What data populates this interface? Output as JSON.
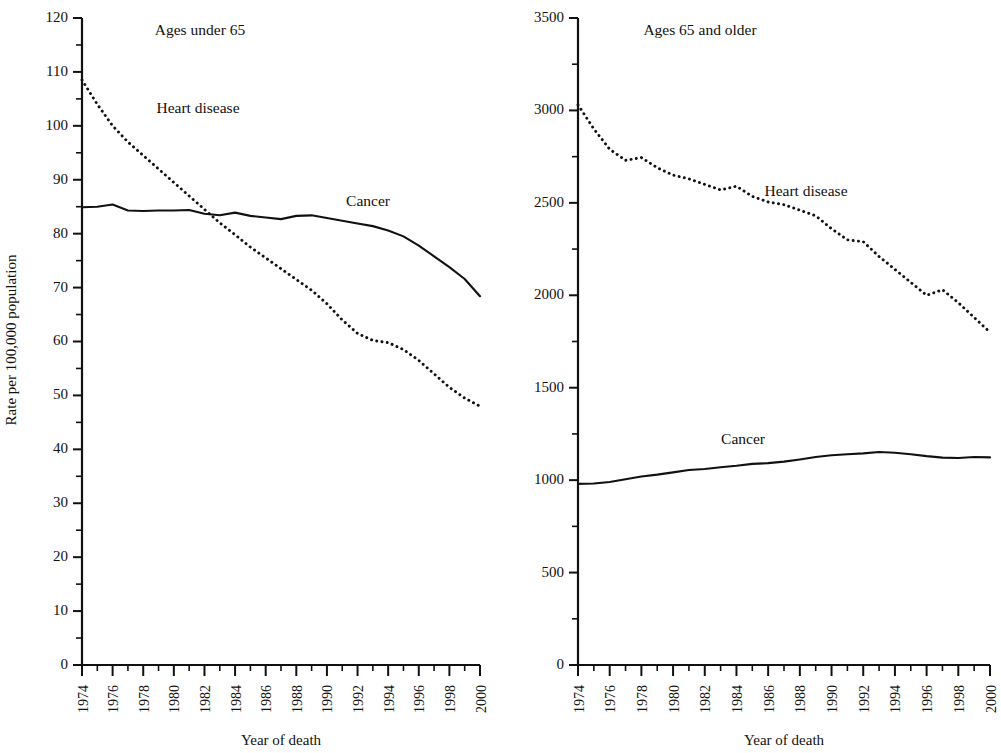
{
  "figure": {
    "x_axis_title": "Year of death",
    "y_axis_title": "Rate per 100,000 population"
  },
  "panels": {
    "left": {
      "title": "Ages under 65",
      "series_label_heart": "Heart disease",
      "series_label_cancer": "Cancer"
    },
    "right": {
      "title": "Ages 65 and older",
      "series_label_heart": "Heart disease",
      "series_label_cancer": "Cancer"
    }
  },
  "chart_data": [
    {
      "type": "line",
      "title": "Ages under 65",
      "xlabel": "Year of death",
      "ylabel": "Rate per 100,000 population",
      "xlim": [
        1974,
        2000
      ],
      "ylim": [
        0,
        120
      ],
      "ytick_labels": [
        "0",
        "10",
        "20",
        "30",
        "40",
        "50",
        "60",
        "70",
        "80",
        "90",
        "100",
        "110",
        "120"
      ],
      "ytick_values": [
        0,
        10,
        20,
        30,
        40,
        50,
        60,
        70,
        80,
        90,
        100,
        110,
        120
      ],
      "yminor_step": 5,
      "xtick_labels": [
        "1974",
        "1976",
        "1978",
        "1980",
        "1982",
        "1984",
        "1986",
        "1988",
        "1990",
        "1992",
        "1994",
        "1996",
        "1998",
        "2000"
      ],
      "xtick_values": [
        1974,
        1976,
        1978,
        1980,
        1982,
        1984,
        1986,
        1988,
        1990,
        1992,
        1994,
        1996,
        1998,
        2000
      ],
      "xminor_step": 1,
      "grid": false,
      "legend": "inline-annotation",
      "x": [
        1974,
        1975,
        1976,
        1977,
        1978,
        1979,
        1980,
        1981,
        1982,
        1983,
        1984,
        1985,
        1986,
        1987,
        1988,
        1989,
        1990,
        1991,
        1992,
        1993,
        1994,
        1995,
        1996,
        1997,
        1998,
        1999,
        2000
      ],
      "series": [
        {
          "name": "Heart disease",
          "style": "dotted",
          "values": [
            108.5,
            104.0,
            100.0,
            97.0,
            94.5,
            92.0,
            89.5,
            87.0,
            84.5,
            82.0,
            79.8,
            77.5,
            75.5,
            73.5,
            71.5,
            69.5,
            67.0,
            64.0,
            61.5,
            60.2,
            59.8,
            58.5,
            56.5,
            54.0,
            51.5,
            49.5,
            48.0
          ]
        },
        {
          "name": "Cancer",
          "style": "solid",
          "values": [
            84.9,
            85.0,
            85.4,
            84.3,
            84.2,
            84.3,
            84.3,
            84.4,
            83.7,
            83.4,
            83.9,
            83.3,
            83.0,
            82.7,
            83.3,
            83.4,
            82.9,
            82.4,
            81.9,
            81.4,
            80.6,
            79.5,
            77.8,
            75.8,
            73.8,
            71.6,
            68.4,
            66.0
          ]
        }
      ]
    },
    {
      "type": "line",
      "title": "Ages 65 and older",
      "xlabel": "Year of death",
      "ylabel": "Rate per 100,000 population",
      "xlim": [
        1974,
        2000
      ],
      "ylim": [
        0,
        3500
      ],
      "ytick_labels": [
        "0",
        "500",
        "1000",
        "1500",
        "2000",
        "2500",
        "3000",
        "3500"
      ],
      "ytick_values": [
        0,
        500,
        1000,
        1500,
        2000,
        2500,
        3000,
        3500
      ],
      "yminor_step": 250,
      "xtick_labels": [
        "1974",
        "1976",
        "1978",
        "1980",
        "1982",
        "1984",
        "1986",
        "1988",
        "1990",
        "1992",
        "1994",
        "1996",
        "1998",
        "2000"
      ],
      "xtick_values": [
        1974,
        1976,
        1978,
        1980,
        1982,
        1984,
        1986,
        1988,
        1990,
        1992,
        1994,
        1996,
        1998,
        2000
      ],
      "xminor_step": 1,
      "grid": false,
      "legend": "inline-annotation",
      "x": [
        1974,
        1975,
        1976,
        1977,
        1978,
        1979,
        1980,
        1981,
        1982,
        1983,
        1984,
        1985,
        1986,
        1987,
        1988,
        1989,
        1990,
        1991,
        1992,
        1993,
        1994,
        1995,
        1996,
        1997,
        1998,
        1999,
        2000
      ],
      "series": [
        {
          "name": "Heart disease",
          "style": "dotted",
          "values": [
            3030,
            2900,
            2790,
            2730,
            2745,
            2690,
            2650,
            2630,
            2600,
            2570,
            2590,
            2535,
            2505,
            2490,
            2460,
            2430,
            2360,
            2300,
            2290,
            2210,
            2140,
            2070,
            2000,
            2030,
            1960,
            1880,
            1800
          ]
        },
        {
          "name": "Cancer",
          "style": "solid",
          "values": [
            980,
            982,
            990,
            1005,
            1020,
            1030,
            1042,
            1055,
            1060,
            1070,
            1078,
            1088,
            1092,
            1100,
            1112,
            1125,
            1135,
            1140,
            1145,
            1152,
            1148,
            1140,
            1130,
            1122,
            1120,
            1125,
            1123
          ]
        }
      ]
    }
  ]
}
